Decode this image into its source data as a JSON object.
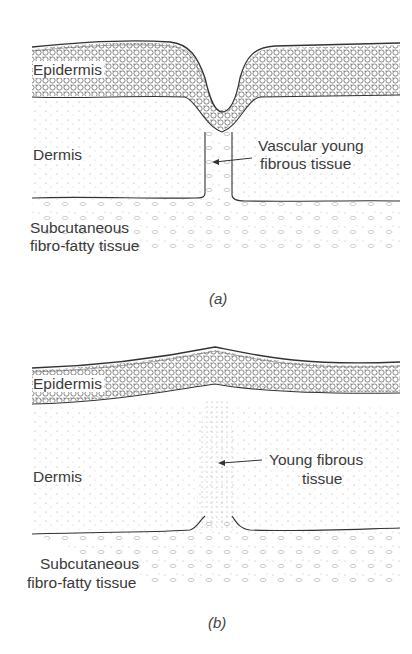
{
  "figure": {
    "panels": [
      {
        "id": "a",
        "caption": "(a)",
        "labels": {
          "epidermis": "Epidermis",
          "dermis": "Dermis",
          "subcutaneous_line1": "Subcutaneous",
          "subcutaneous_line2": "fibro-fatty tissue",
          "annotation_line1": "Vascular young",
          "annotation_line2": "fibrous tissue"
        }
      },
      {
        "id": "b",
        "caption": "(b)",
        "labels": {
          "epidermis": "Epidermis",
          "dermis": "Dermis",
          "subcutaneous_line1": "Subcutaneous",
          "subcutaneous_line2": "fibro-fatty tissue",
          "annotation_line1": "Young fibrous",
          "annotation_line2": "tissue"
        }
      }
    ],
    "colors": {
      "ink": "#3a3a3a",
      "background": "#ffffff"
    }
  }
}
